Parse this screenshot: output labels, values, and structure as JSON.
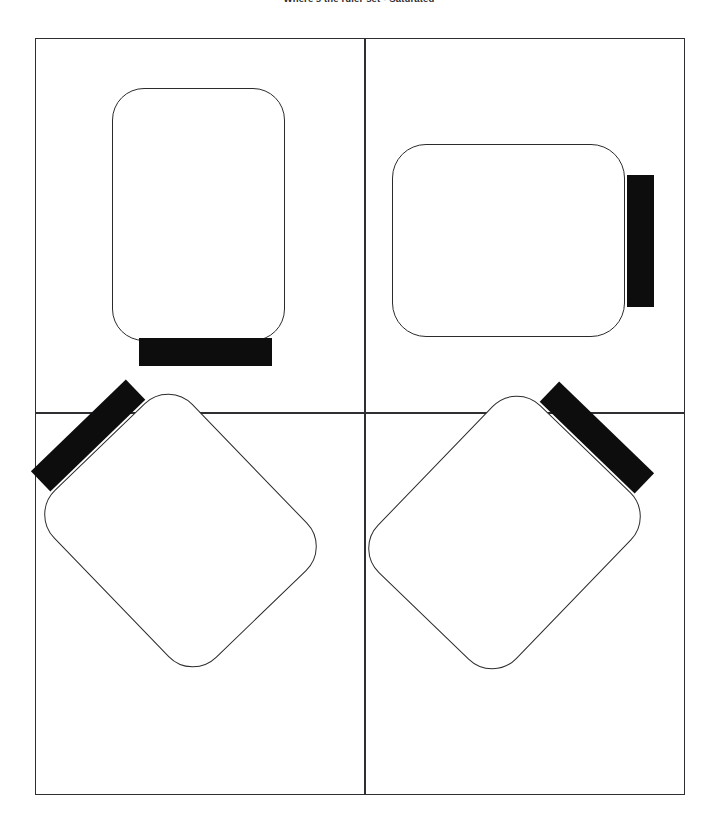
{
  "figure": {
    "title": "Where's the ruler set - Saturated",
    "background_color": "#ffffff",
    "outline_color": "#2f2f33",
    "object_outline_color": "#2b2b2b",
    "bar_color": "#0d0d0d",
    "layout": "2x2 grid of panels, each showing one rounded-rectangle object with an attached black bar",
    "panel_count": 4
  },
  "diagram_data": {
    "type": "diagram",
    "title": "Where's the ruler set - Saturated",
    "grid": {
      "rows": 2,
      "columns": 4
    },
    "frame": {
      "x": 35,
      "y": 38,
      "width": 650,
      "height": 757
    },
    "divider_intersection": {
      "x": 364,
      "y": 413
    },
    "panels": [
      {
        "id": "panel-1",
        "position": "top-left",
        "object_shape": "rounded-rectangle",
        "orientation": "portrait",
        "rotation_degrees": 0,
        "bar_edge": "bottom",
        "body_bounds": {
          "x": 112,
          "y": 88,
          "width": 173,
          "height": 253
        },
        "corner_radius": 32,
        "bar_bounds": {
          "x": 139,
          "y": 338,
          "width": 133,
          "height": 28
        }
      },
      {
        "id": "panel-2",
        "position": "top-right",
        "object_shape": "rounded-rectangle",
        "orientation": "landscape",
        "rotation_degrees": 0,
        "bar_edge": "right",
        "body_bounds": {
          "x": 392,
          "y": 144,
          "width": 233,
          "height": 193
        },
        "corner_radius": 34,
        "bar_bounds": {
          "x": 627,
          "y": 175,
          "width": 27,
          "height": 132
        }
      },
      {
        "id": "panel-3",
        "position": "bottom-left",
        "object_shape": "rounded-rectangle",
        "orientation": "rotated",
        "rotation_degrees": 46,
        "bar_edge": "upper-left",
        "corner_radius": 34
      },
      {
        "id": "panel-4",
        "position": "bottom-right",
        "object_shape": "rounded-rectangle",
        "orientation": "rotated",
        "rotation_degrees": -46,
        "bar_edge": "upper-right",
        "corner_radius": 34
      }
    ]
  }
}
